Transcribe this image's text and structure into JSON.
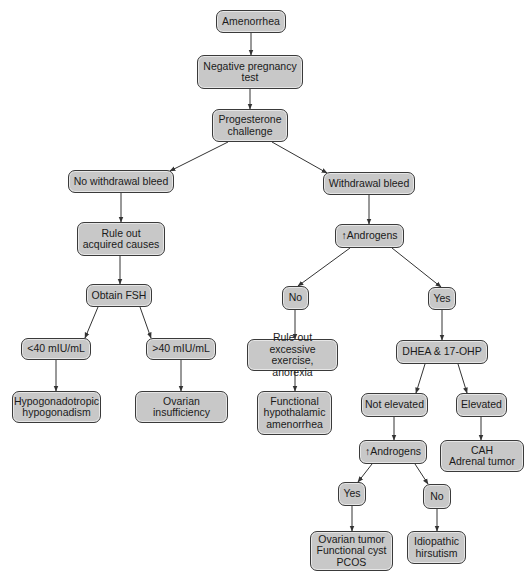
{
  "diagram": {
    "type": "flowchart",
    "nodes": [
      {
        "id": "amenorrhea",
        "label": "Amenorrhea",
        "x": 216,
        "y": 10,
        "w": 70,
        "h": 23
      },
      {
        "id": "neg_preg",
        "label": "Negative pregnancy\ntest",
        "x": 197,
        "y": 55,
        "w": 106,
        "h": 34
      },
      {
        "id": "progesterone",
        "label": "Progesterone\nchallenge",
        "x": 212,
        "y": 109,
        "w": 76,
        "h": 33
      },
      {
        "id": "no_withdrawal",
        "label": "No withdrawal bleed",
        "x": 68,
        "y": 170,
        "w": 106,
        "h": 23
      },
      {
        "id": "withdrawal",
        "label": "Withdrawal bleed",
        "x": 323,
        "y": 172,
        "w": 92,
        "h": 23
      },
      {
        "id": "rule_out_acquired",
        "label": "Rule out\nacquired causes",
        "x": 77,
        "y": 222,
        "w": 88,
        "h": 34
      },
      {
        "id": "androgens1",
        "label": "↑Androgens",
        "x": 335,
        "y": 224,
        "w": 69,
        "h": 24
      },
      {
        "id": "obtain_fsh",
        "label": "Obtain FSH",
        "x": 86,
        "y": 284,
        "w": 66,
        "h": 23
      },
      {
        "id": "no1",
        "label": "No",
        "x": 282,
        "y": 286,
        "w": 27,
        "h": 24
      },
      {
        "id": "yes1",
        "label": "Yes",
        "x": 428,
        "y": 287,
        "w": 28,
        "h": 23
      },
      {
        "id": "lt40",
        "label": "<40 mIU/mL",
        "x": 21,
        "y": 338,
        "w": 70,
        "h": 22
      },
      {
        "id": "gt40",
        "label": ">40 mIU/mL",
        "x": 146,
        "y": 338,
        "w": 70,
        "h": 22
      },
      {
        "id": "rule_out_exercise",
        "label": "Rule out excessive\nexercise, anorexia",
        "x": 247,
        "y": 339,
        "w": 91,
        "h": 32
      },
      {
        "id": "dhea",
        "label": "DHEA & 17-OHP",
        "x": 396,
        "y": 340,
        "w": 92,
        "h": 24
      },
      {
        "id": "hypogonadotropic",
        "label": "Hypogonadotropic\nhypogonadism",
        "x": 12,
        "y": 391,
        "w": 89,
        "h": 32
      },
      {
        "id": "ovarian_insufficiency",
        "label": "Ovarian\ninsufficiency",
        "x": 135,
        "y": 391,
        "w": 93,
        "h": 32
      },
      {
        "id": "fha",
        "label": "Functional\nhypothalamic\namenorrhea",
        "x": 257,
        "y": 391,
        "w": 75,
        "h": 44
      },
      {
        "id": "not_elevated",
        "label": "Not elevated",
        "x": 361,
        "y": 393,
        "w": 67,
        "h": 24
      },
      {
        "id": "elevated",
        "label": "Elevated",
        "x": 456,
        "y": 393,
        "w": 51,
        "h": 24
      },
      {
        "id": "androgens2",
        "label": "↑Androgens",
        "x": 359,
        "y": 440,
        "w": 68,
        "h": 24
      },
      {
        "id": "cah",
        "label": "CAH\nAdrenal tumor",
        "x": 440,
        "y": 440,
        "w": 84,
        "h": 32
      },
      {
        "id": "yes2",
        "label": "Yes",
        "x": 338,
        "y": 482,
        "w": 28,
        "h": 24
      },
      {
        "id": "no2",
        "label": "No",
        "x": 423,
        "y": 484,
        "w": 28,
        "h": 25
      },
      {
        "id": "ovarian_tumor",
        "label": "Ovarian tumor\nFunctional cyst\nPCOS",
        "x": 310,
        "y": 531,
        "w": 83,
        "h": 40
      },
      {
        "id": "idiopathic",
        "label": "Idiopathic\nhirsutism",
        "x": 407,
        "y": 531,
        "w": 59,
        "h": 33
      }
    ],
    "edges": [
      {
        "from": "amenorrhea",
        "to": "neg_preg",
        "x1": 251,
        "y1": 33,
        "x2": 251,
        "y2": 55
      },
      {
        "from": "neg_preg",
        "to": "progesterone",
        "x1": 250,
        "y1": 89,
        "x2": 250,
        "y2": 109
      },
      {
        "from": "progesterone",
        "to": "no_withdrawal",
        "x1": 228,
        "y1": 142,
        "x2": 170,
        "y2": 171
      },
      {
        "from": "progesterone",
        "to": "withdrawal",
        "x1": 272,
        "y1": 142,
        "x2": 327,
        "y2": 173
      },
      {
        "from": "no_withdrawal",
        "to": "rule_out_acquired",
        "x1": 121,
        "y1": 193,
        "x2": 121,
        "y2": 222
      },
      {
        "from": "withdrawal",
        "to": "androgens1",
        "x1": 369,
        "y1": 195,
        "x2": 369,
        "y2": 224
      },
      {
        "from": "rule_out_acquired",
        "to": "obtain_fsh",
        "x1": 120,
        "y1": 256,
        "x2": 120,
        "y2": 284
      },
      {
        "from": "androgens1",
        "to": "no1",
        "x1": 350,
        "y1": 248,
        "x2": 298,
        "y2": 286
      },
      {
        "from": "androgens1",
        "to": "yes1",
        "x1": 392,
        "y1": 248,
        "x2": 441,
        "y2": 287
      },
      {
        "from": "obtain_fsh",
        "to": "lt40",
        "x1": 98,
        "y1": 307,
        "x2": 85,
        "y2": 338
      },
      {
        "from": "obtain_fsh",
        "to": "gt40",
        "x1": 140,
        "y1": 307,
        "x2": 151,
        "y2": 338
      },
      {
        "from": "no1",
        "to": "rule_out_exercise",
        "x1": 295,
        "y1": 310,
        "x2": 295,
        "y2": 339
      },
      {
        "from": "yes1",
        "to": "dhea",
        "x1": 442,
        "y1": 310,
        "x2": 442,
        "y2": 340
      },
      {
        "from": "lt40",
        "to": "hypogonadotropic",
        "x1": 56,
        "y1": 360,
        "x2": 56,
        "y2": 391
      },
      {
        "from": "gt40",
        "to": "ovarian_insufficiency",
        "x1": 181,
        "y1": 360,
        "x2": 181,
        "y2": 391
      },
      {
        "from": "rule_out_exercise",
        "to": "fha",
        "x1": 295,
        "y1": 371,
        "x2": 295,
        "y2": 391
      },
      {
        "from": "dhea",
        "to": "not_elevated",
        "x1": 425,
        "y1": 364,
        "x2": 416,
        "y2": 393
      },
      {
        "from": "dhea",
        "to": "elevated",
        "x1": 458,
        "y1": 364,
        "x2": 467,
        "y2": 393
      },
      {
        "from": "not_elevated",
        "to": "androgens2",
        "x1": 394,
        "y1": 417,
        "x2": 394,
        "y2": 440
      },
      {
        "from": "elevated",
        "to": "cah",
        "x1": 481,
        "y1": 417,
        "x2": 481,
        "y2": 440
      },
      {
        "from": "androgens2",
        "to": "yes2",
        "x1": 372,
        "y1": 464,
        "x2": 358,
        "y2": 482
      },
      {
        "from": "androgens2",
        "to": "no2",
        "x1": 415,
        "y1": 464,
        "x2": 428,
        "y2": 484
      },
      {
        "from": "yes2",
        "to": "ovarian_tumor",
        "x1": 352,
        "y1": 506,
        "x2": 352,
        "y2": 531
      },
      {
        "from": "no2",
        "to": "idiopathic",
        "x1": 437,
        "y1": 509,
        "x2": 437,
        "y2": 531
      }
    ],
    "style": {
      "node_fill": "#c8c8c8",
      "node_border": "#3a3a3a",
      "edge_color": "#333333",
      "background": "#ffffff"
    }
  }
}
